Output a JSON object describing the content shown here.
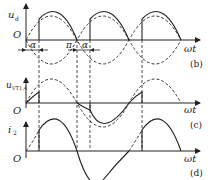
{
  "diagram": {
    "type": "waveform-diagram",
    "panels": [
      {
        "id": "b",
        "tag": "(b)",
        "y_label": "u",
        "y_label_sub": "d",
        "origin_label": "O",
        "x_label": "ωt",
        "annotations": [
          "α",
          "π",
          "α"
        ]
      },
      {
        "id": "c",
        "tag": "(c)",
        "y_label": "u",
        "y_label_sub": "VT1,4",
        "origin_label": "O",
        "x_label": "ωt"
      },
      {
        "id": "d",
        "tag": "(d)",
        "y_label": "i",
        "y_label_sub": "2",
        "origin_label": "O",
        "x_label": "ωt"
      }
    ],
    "colors": {
      "stroke": "#222222",
      "background": "#ffffff"
    }
  }
}
